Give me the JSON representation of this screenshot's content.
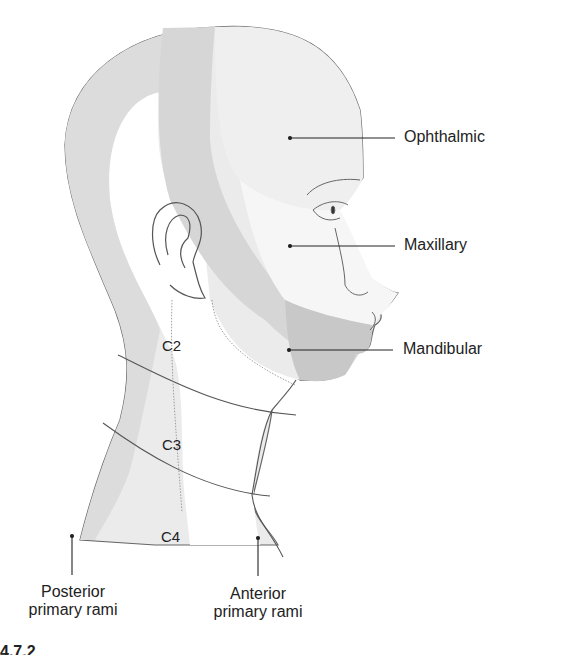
{
  "diagram": {
    "type": "anatomical-dermatome-head-neck",
    "colors": {
      "ophthalmic_fill": "#eeeeee",
      "maxillary_fill": "#f4f4f4",
      "mandibular_fill": "#c9c9c9",
      "posterior_band": "#d8d8d8",
      "c2_band": "#e6e6e6",
      "outline": "#555555"
    },
    "labels": {
      "ophthalmic": "Ophthalmic",
      "maxillary": "Maxillary",
      "mandibular": "Mandibular",
      "posterior_line1": "Posterior",
      "posterior_line2": "primary rami",
      "anterior_line1": "Anterior",
      "anterior_line2": "primary rami"
    },
    "segments": [
      "C2",
      "C3",
      "C4"
    ],
    "figure_number_fragment": "4.7.2"
  }
}
